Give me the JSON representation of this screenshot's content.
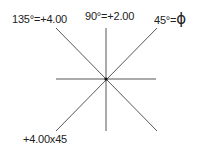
{
  "diagram": {
    "title": "",
    "center": {
      "x": 106,
      "y": 79
    },
    "line_color": "#444444",
    "labels": {
      "deg135": "135°=+4.00",
      "deg90": "90°=+2.00",
      "deg45_prefix": "45°=",
      "deg45_value": "ϕ",
      "prescription": "+4.00x45"
    }
  }
}
